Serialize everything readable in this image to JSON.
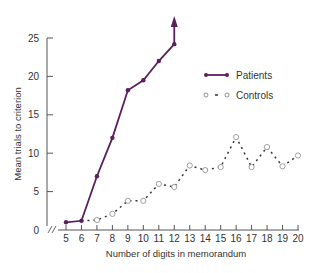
{
  "chart_data": {
    "type": "line",
    "title": "",
    "xlabel": "Number of digits in memorandum",
    "ylabel": "Mean trials to criterion",
    "xlim": [
      5,
      20
    ],
    "ylim": [
      0,
      25
    ],
    "x_ticks": [
      5,
      6,
      7,
      8,
      9,
      10,
      11,
      12,
      13,
      14,
      15,
      16,
      17,
      18,
      19,
      20
    ],
    "y_ticks": [
      0,
      5,
      10,
      15,
      20,
      25
    ],
    "grid": false,
    "legend_position": "upper right",
    "axis_break": true,
    "series": [
      {
        "name": "Patients",
        "style": "solid line, filled markers",
        "color": "#5a1f5e",
        "x": [
          5,
          6,
          7,
          8,
          9,
          10,
          11,
          12
        ],
        "values": [
          1.0,
          1.2,
          7.0,
          12.0,
          18.2,
          19.5,
          22.0,
          24.2
        ],
        "annotation": "arrow pointing up after 12 digits (criterion not reached)"
      },
      {
        "name": "Controls",
        "style": "dashed line, open markers",
        "color": "#333333",
        "x": [
          6,
          7,
          8,
          9,
          10,
          11,
          12,
          13,
          14,
          15,
          16,
          17,
          18,
          19,
          20
        ],
        "values": [
          1.2,
          1.3,
          2.1,
          3.8,
          3.8,
          6.0,
          5.6,
          8.4,
          7.8,
          8.2,
          12.1,
          8.2,
          10.8,
          8.3,
          9.7
        ]
      }
    ]
  },
  "legend": {
    "patients_label": "Patients",
    "controls_label": "Controls"
  },
  "axes": {
    "xlabel": "Number of digits in memorandum",
    "ylabel": "Mean trials to criterion"
  }
}
